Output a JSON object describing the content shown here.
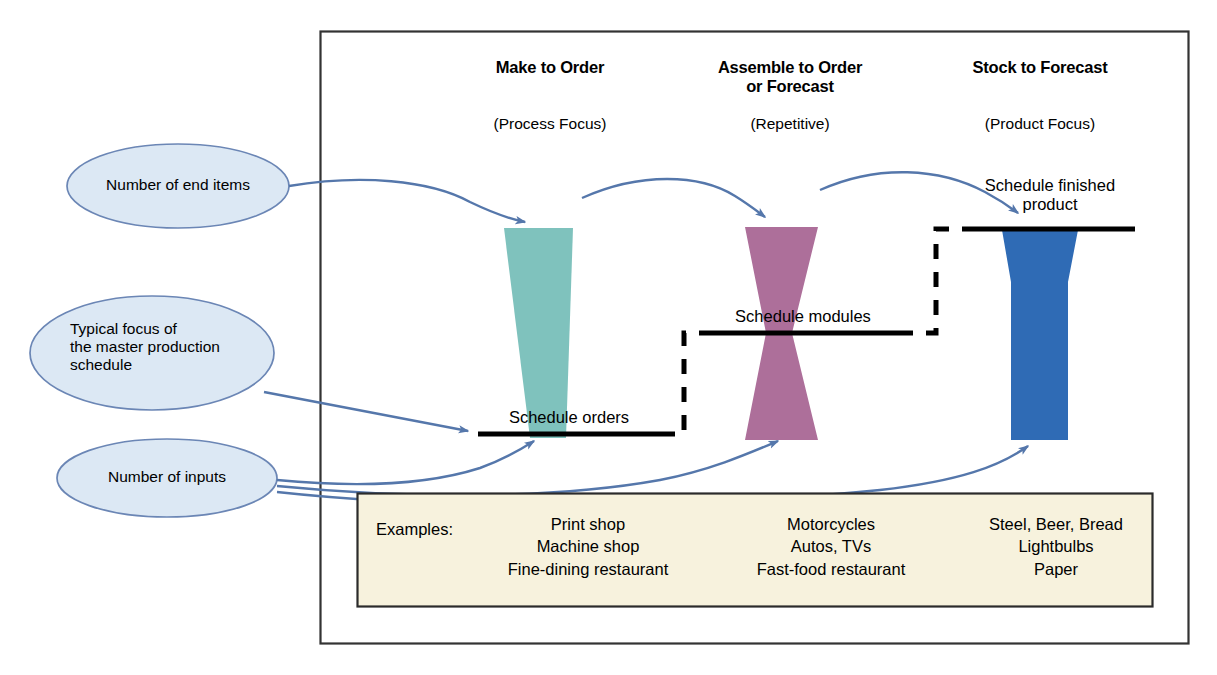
{
  "figure": {
    "title_columns": [
      {
        "title": "Make to Order",
        "subtitle": "(Process Focus)"
      },
      {
        "title": "Assemble to Order\nor Forecast",
        "subtitle": "(Repetitive)"
      },
      {
        "title": "Stock to Forecast",
        "subtitle": "(Product Focus)"
      }
    ],
    "callouts": [
      {
        "id": "end-items",
        "label": "Number of end items"
      },
      {
        "id": "mps-focus",
        "label": "Typical focus of\nthe master production\nschedule"
      },
      {
        "id": "inputs",
        "label": "Number of inputs"
      }
    ],
    "schedule_levels": [
      {
        "id": "orders",
        "label": "Schedule orders"
      },
      {
        "id": "modules",
        "label": "Schedule modules"
      },
      {
        "id": "finished",
        "label": "Schedule finished\nproduct"
      }
    ],
    "shapes": [
      {
        "id": "make-to-order-funnel",
        "name": "narrowing-trapezoid",
        "color": "#7fc2bd"
      },
      {
        "id": "assemble-to-order-hourglass",
        "name": "hourglass",
        "color": "#ad6f9a"
      },
      {
        "id": "stock-to-forecast-funnel",
        "name": "wide-top-funnel",
        "color": "#2f6bb5"
      }
    ],
    "examples": {
      "heading": "Examples:",
      "columns": [
        [
          "Print shop",
          "Machine shop",
          "Fine-dining restaurant"
        ],
        [
          "Motorcycles",
          "Autos, TVs",
          "Fast-food restaurant"
        ],
        [
          "Steel, Beer, Bread",
          "Lightbulbs",
          "Paper"
        ]
      ]
    },
    "colors": {
      "teal": "#7fc2bd",
      "purple": "#ad6f9a",
      "blue": "#2f6bb5",
      "callout_fill": "#dce8f4",
      "callout_stroke": "#6b86b5",
      "arrow": "#5577ab",
      "examples_fill": "#f7f2dd",
      "examples_stroke": "#2b2b2b",
      "frame_stroke": "#333333",
      "rule": "#000000"
    }
  }
}
